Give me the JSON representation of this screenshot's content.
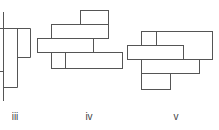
{
  "figures": [
    {
      "label": "iii",
      "label_x": 15
    },
    {
      "label": "iv",
      "label_x": 89
    },
    {
      "label": "v",
      "label_x": 176
    }
  ],
  "stroke_color": "#555555"
}
